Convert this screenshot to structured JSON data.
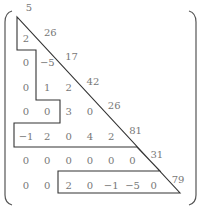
{
  "figure": {
    "matrix": {
      "size": 8,
      "rows": [
        [
          "5"
        ],
        [
          "2",
          "26"
        ],
        [
          "0",
          "−5",
          "17"
        ],
        [
          "0",
          "1",
          "2",
          "42"
        ],
        [
          "0",
          "0",
          "3",
          "0",
          "26"
        ],
        [
          "−1",
          "2",
          "0",
          "4",
          "2",
          "81"
        ],
        [
          "0",
          "0",
          "0",
          "0",
          "0",
          "0",
          "31"
        ],
        [
          "0",
          "0",
          "2",
          "0",
          "−1",
          "−5",
          "0",
          "79"
        ]
      ]
    },
    "outline_color": "#333333",
    "text_color": "#777777",
    "bracket_color": "#555555"
  }
}
